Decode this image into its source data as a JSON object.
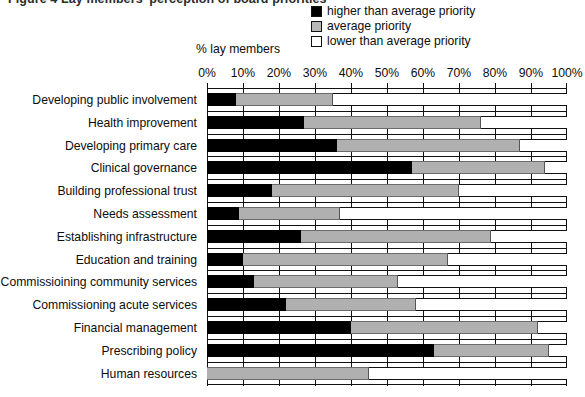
{
  "figure": {
    "caption": "Figure 4  Lay members' perception of board priorities"
  },
  "legend": {
    "position": "top-right",
    "items": [
      {
        "label": "higher than average priority",
        "color": "#000000",
        "swatch": "black-square-icon"
      },
      {
        "label": "average priority",
        "color": "#b8b8b8",
        "swatch": "gray-square-icon"
      },
      {
        "label": "lower than average priority",
        "color": "#ffffff",
        "swatch": "white-square-icon"
      }
    ]
  },
  "axis": {
    "caption": "% lay members",
    "ticks": [
      "0%",
      "10%",
      "20%",
      "30%",
      "40%",
      "50%",
      "60%",
      "70%",
      "80%",
      "90%",
      "100%"
    ]
  },
  "chart_data": {
    "type": "bar",
    "orientation": "horizontal",
    "stacked": true,
    "title": "Figure 4  Lay members' perception of board priorities",
    "xlabel": "% lay members",
    "ylabel": "",
    "xlim": [
      0,
      100
    ],
    "grid": true,
    "legend_position": "top-right",
    "categories": [
      "Developing public involvement",
      "Health improvement",
      "Developing primary care",
      "Clinical governance",
      "Building professional trust",
      "Needs assessment",
      "Establishing infrastructure",
      "Education and training",
      "Commissioining community services",
      "Commissioning acute services",
      "Financial management",
      "Prescribing policy",
      "Human resources"
    ],
    "series": [
      {
        "name": "higher than average priority",
        "color": "#000000",
        "values": [
          8,
          27,
          36,
          57,
          18,
          9,
          26,
          10,
          13,
          22,
          40,
          63,
          0
        ]
      },
      {
        "name": "average priority",
        "color": "#b0b0b0",
        "values": [
          27,
          49,
          51,
          37,
          52,
          28,
          53,
          57,
          40,
          36,
          52,
          32,
          45
        ]
      },
      {
        "name": "lower than average priority",
        "color": "#ffffff",
        "values": [
          65,
          24,
          13,
          6,
          30,
          63,
          21,
          33,
          47,
          42,
          8,
          5,
          55
        ]
      }
    ]
  }
}
